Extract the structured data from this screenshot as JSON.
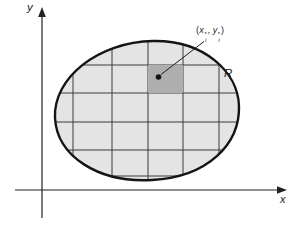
{
  "figure": {
    "grid_x": [
      73,
      112,
      148,
      183,
      219
    ],
    "grid_y": [
      65,
      93,
      122,
      150,
      176
    ],
    "grid_extent": {
      "x1": 52,
      "x2": 242,
      "y1": 38,
      "y2": 182
    },
    "cell": {
      "x": 148,
      "y": 65,
      "w": 35,
      "h": 28
    },
    "sample_point": {
      "x": 158.5,
      "y": 77,
      "r": 2.8
    }
  },
  "labels": {
    "y_axis": "y",
    "x_axis": "x",
    "region": "R",
    "point": {
      "open": "(",
      "x_var": "x",
      "star": "*",
      "index": "i",
      "comma": ",",
      "y_var": "y",
      "close": ")"
    }
  },
  "colors": {
    "region_fill": "#e4e4e4",
    "cell_fill": "#aeaeae",
    "outline": "#141414",
    "grid_line": "#3a3a3a",
    "axis": "#222222"
  }
}
